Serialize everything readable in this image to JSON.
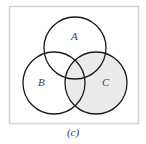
{
  "figure": {
    "caption": "(c)",
    "frame": {
      "x": 9,
      "y": 6,
      "w": 129,
      "h": 117,
      "stroke": "#d4d4d4"
    },
    "sets": [
      {
        "name": "A",
        "label": "A",
        "cx": 75,
        "cy": 48,
        "r": 31,
        "shaded": false
      },
      {
        "name": "B",
        "label": "B",
        "cx": 54,
        "cy": 83,
        "r": 31,
        "shaded": false
      },
      {
        "name": "C",
        "label": "C",
        "cx": 96,
        "cy": 83,
        "r": 31,
        "shaded": true
      }
    ],
    "shade_color": "#ebebeb",
    "stroke_color": "#1a1a1a",
    "shaded_region": "C"
  }
}
